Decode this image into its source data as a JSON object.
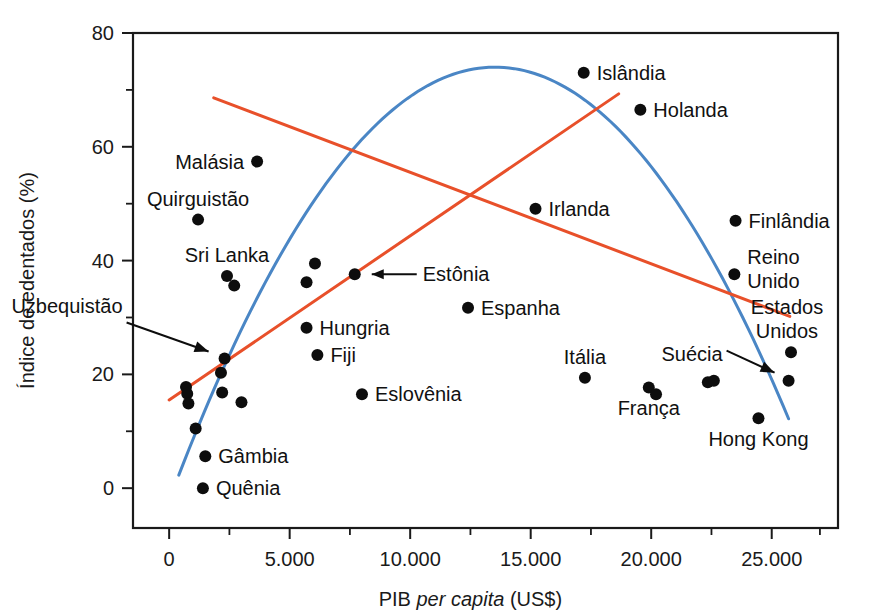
{
  "chart_data": {
    "type": "scatter",
    "title": "",
    "xlabel_parts": {
      "pre": "PIB ",
      "italic": "per capita",
      "post": " (US$)"
    },
    "xlabel": "PIB per capita (US$)",
    "ylabel": "Índice de edentados (%)",
    "xlim": [
      -1500,
      27750
    ],
    "ylim": [
      -7.0,
      80.0
    ],
    "grid": false,
    "legend_position": "none",
    "x_ticks": [
      0,
      5000,
      10000,
      15000,
      20000,
      25000
    ],
    "x_tick_labels": [
      "0",
      "5.000",
      "10.000",
      "15.000",
      "20.000",
      "25.000"
    ],
    "x_minor_ticks": [
      2500,
      7500,
      12500,
      17500,
      22500,
      27000
    ],
    "y_ticks": [
      0,
      20,
      40,
      60,
      80
    ],
    "y_tick_labels": [
      "0",
      "20",
      "40",
      "60",
      "80"
    ],
    "y_minor_ticks": [
      10,
      30,
      50,
      70
    ],
    "points": [
      {
        "label": "Malásia",
        "x": 3650,
        "y": 57.4,
        "label_pos": "left"
      },
      {
        "label": "Quirguistão",
        "x": 1200,
        "y": 47.2,
        "label_pos": "above"
      },
      {
        "label": "Sri Lanka",
        "x": 2400,
        "y": 37.3,
        "label_pos": "above"
      },
      {
        "label": "",
        "x": 2700,
        "y": 35.6,
        "label_pos": "none"
      },
      {
        "label": "",
        "x": 5700,
        "y": 36.2,
        "label_pos": "none"
      },
      {
        "label": "",
        "x": 6050,
        "y": 39.5,
        "label_pos": "none"
      },
      {
        "label": "Estônia",
        "x": 7700,
        "y": 37.6,
        "label_pos": "leader-right"
      },
      {
        "label": "Uzbequistão",
        "x": 2300,
        "y": 22.8,
        "label_pos": "leader-upleft"
      },
      {
        "label": "",
        "x": 2150,
        "y": 20.3,
        "label_pos": "none"
      },
      {
        "label": "",
        "x": 700,
        "y": 17.8,
        "label_pos": "none"
      },
      {
        "label": "",
        "x": 750,
        "y": 16.6,
        "label_pos": "none"
      },
      {
        "label": "",
        "x": 800,
        "y": 14.9,
        "label_pos": "none"
      },
      {
        "label": "",
        "x": 2200,
        "y": 16.8,
        "label_pos": "none"
      },
      {
        "label": "",
        "x": 3000,
        "y": 15.1,
        "label_pos": "none"
      },
      {
        "label": "",
        "x": 1100,
        "y": 10.5,
        "label_pos": "none"
      },
      {
        "label": "Gâmbia",
        "x": 1500,
        "y": 5.6,
        "label_pos": "right"
      },
      {
        "label": "Quênia",
        "x": 1400,
        "y": 0.0,
        "label_pos": "right"
      },
      {
        "label": "Hungria",
        "x": 5700,
        "y": 28.2,
        "label_pos": "right"
      },
      {
        "label": "Fiji",
        "x": 6150,
        "y": 23.4,
        "label_pos": "right"
      },
      {
        "label": "Eslovênia",
        "x": 8000,
        "y": 16.5,
        "label_pos": "right"
      },
      {
        "label": "Espanha",
        "x": 12400,
        "y": 31.7,
        "label_pos": "right"
      },
      {
        "label": "Irlanda",
        "x": 15200,
        "y": 49.1,
        "label_pos": "right"
      },
      {
        "label": "Islândia",
        "x": 17200,
        "y": 73.0,
        "label_pos": "right"
      },
      {
        "label": "Holanda",
        "x": 19550,
        "y": 66.5,
        "label_pos": "right"
      },
      {
        "label": "Itália",
        "x": 17250,
        "y": 19.4,
        "label_pos": "above"
      },
      {
        "label": "França",
        "x": 19900,
        "y": 17.7,
        "label_pos": "below"
      },
      {
        "label": "",
        "x": 20200,
        "y": 16.5,
        "label_pos": "none"
      },
      {
        "label": "Suécia",
        "x": 25700,
        "y": 18.9,
        "label_pos": "leader-left"
      },
      {
        "label": "",
        "x": 22350,
        "y": 18.6,
        "label_pos": "none"
      },
      {
        "label": "",
        "x": 22600,
        "y": 18.9,
        "label_pos": "none"
      },
      {
        "label": "Finlândia",
        "x": 23500,
        "y": 47.0,
        "label_pos": "right"
      },
      {
        "label": "Reino Unido",
        "x": 23450,
        "y": 37.6,
        "label_pos": "right-2line"
      },
      {
        "label": "Estados Unidos",
        "x": 25800,
        "y": 23.9,
        "label_pos": "above-2line"
      },
      {
        "label": "Hong Kong",
        "x": 24450,
        "y": 12.3,
        "label_pos": "below"
      }
    ],
    "trend_lines": [
      {
        "name": "descending-regression",
        "color": "#E8502A",
        "x_start": 1850,
        "y_start": 68.6,
        "x_end": 25750,
        "y_end": 30.2
      },
      {
        "name": "ascending-regression",
        "color": "#E8502A",
        "x_start": 0,
        "y_start": 15.5,
        "x_end": 18650,
        "y_end": 69.3
      }
    ],
    "fitted_curve": {
      "name": "quadratic-fit",
      "color": "#4A86C5",
      "x_start": 400,
      "y_start": 2.3,
      "x_peak": 13500,
      "y_peak": 74.0,
      "x_end": 25700,
      "y_end": 12.2
    }
  },
  "annotations": {
    "uzbequistao_leader": "arrow pointing right-down to Uzbequistão point",
    "estonia_leader": "arrow pointing left to Estônia point",
    "suecia_leader": "arrow pointing right-down to Suécia point"
  }
}
